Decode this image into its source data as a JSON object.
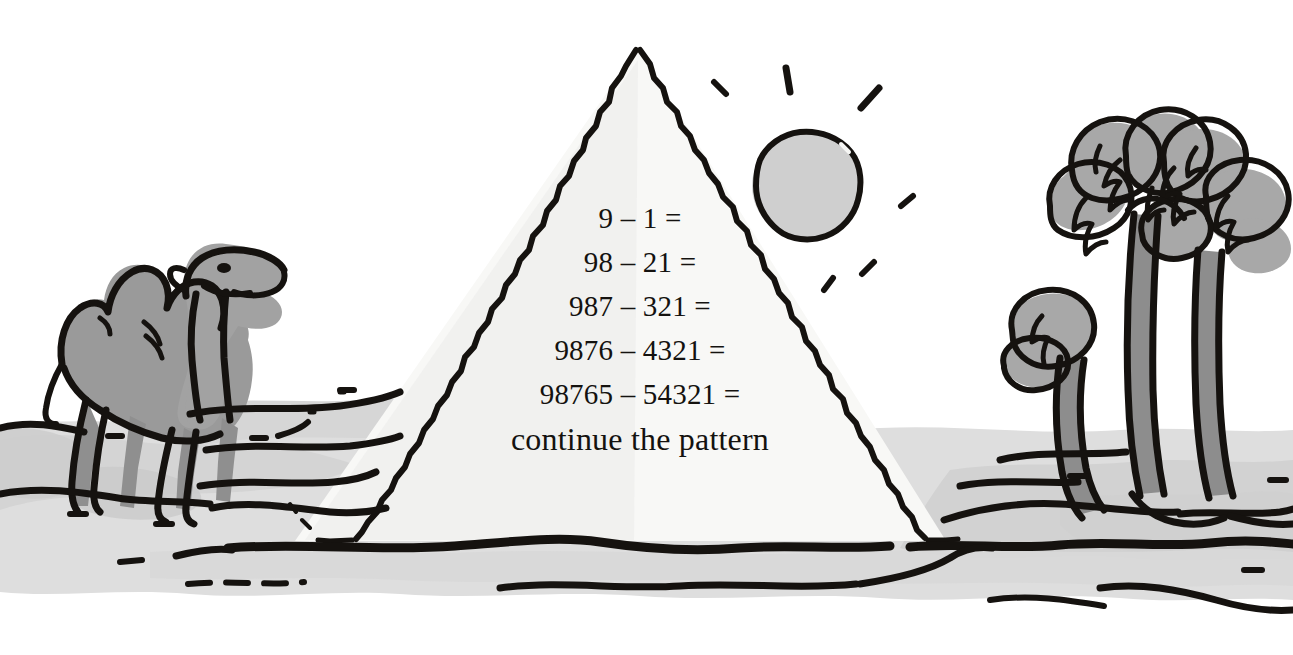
{
  "scene": {
    "title": "Desert pyramid math pattern worksheet",
    "width": 1293,
    "height": 655,
    "background_color": "#ffffff"
  },
  "worksheet": {
    "equations": [
      {
        "left": "9",
        "operator": "–",
        "right": "1",
        "equals": "=",
        "text": "9 – 1 ="
      },
      {
        "left": "98",
        "operator": "–",
        "right": "21",
        "equals": "=",
        "text": "98 – 21 ="
      },
      {
        "left": "987",
        "operator": "–",
        "right": "321",
        "equals": "=",
        "text": "987 – 321 ="
      },
      {
        "left": "9876",
        "operator": "–",
        "right": "4321",
        "equals": "=",
        "text": "9876 – 4321 ="
      },
      {
        "left": "98765",
        "operator": "–",
        "right": "54321",
        "equals": "=",
        "text": "98765 – 54321 ="
      }
    ],
    "instruction": "continue the pattern"
  },
  "illustration": {
    "pyramid": {
      "label": "pyramid",
      "fill_color": "#f8f8f6",
      "outline_color": "#15120f",
      "apex": {
        "x": 638,
        "y": 48
      },
      "base_left": {
        "x": 295,
        "y": 541
      },
      "base_right": {
        "x": 946,
        "y": 541
      }
    },
    "sun": {
      "label": "sun",
      "fill_color": "#cfcfcf",
      "outline_color": "#15120f",
      "center": {
        "x": 806,
        "y": 186
      },
      "radius": 52,
      "ray_count": 6
    },
    "camel": {
      "label": "bactrian camel",
      "body_color": "#9a9a9a",
      "outline_color": "#15120f",
      "humps": 2,
      "facing": "right"
    },
    "palms": {
      "label": "palm trees",
      "frond_color": "#a8a8a8",
      "trunk_color": "#8d8d8d",
      "outline_color": "#15120f",
      "tree_count": 3
    },
    "ground": {
      "label": "desert sand",
      "sand_color": "#dcdcdc",
      "line_color": "#15120f",
      "horizon_y": 548
    }
  }
}
